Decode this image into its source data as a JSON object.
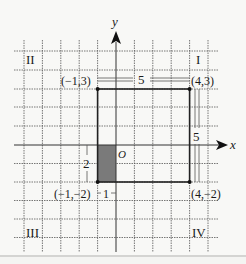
{
  "diagram": {
    "axes": {
      "x_label": "x",
      "y_label": "y",
      "origin_label": "O"
    },
    "quadrants": [
      {
        "label": "I"
      },
      {
        "label": "II"
      },
      {
        "label": "III"
      },
      {
        "label": "IV"
      }
    ],
    "points": [
      {
        "label": "(−1,3)"
      },
      {
        "label": "(4,3)"
      },
      {
        "label": "(−1,−2)"
      },
      {
        "label": "(4,−2)"
      }
    ],
    "dimensions": {
      "top_width": "5",
      "right_height": "5",
      "shaded_height": "2",
      "shaded_width": "1"
    },
    "colors": {
      "grid": "#555555",
      "rect": "#222222",
      "shade": "#7a7a7a",
      "background": "#f8f8f6"
    }
  }
}
